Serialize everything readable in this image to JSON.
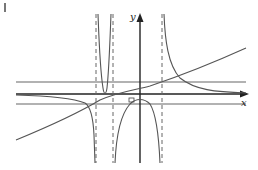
{
  "diagram": {
    "type": "function-graph",
    "labels": {
      "x_axis": "x",
      "y_axis": "y",
      "origin": "O"
    },
    "colors": {
      "curve": "#555555",
      "axis": "#222222",
      "asymptote": "#666666",
      "background": "#ffffff"
    },
    "vertical_asymptotes_dashed": 3,
    "horizontal_reference_lines": 2,
    "elements": [
      "x-axis with arrow",
      "y-axis with arrow",
      "three dashed vertical asymptotes",
      "two horizontal solid reference lines",
      "oblique increasing curve",
      "rational function branches"
    ]
  }
}
